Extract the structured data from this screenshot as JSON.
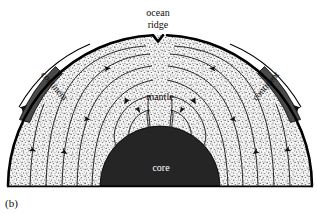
{
  "figure": {
    "panel_label": "(b)",
    "title_note": "",
    "labels": {
      "ocean_ridge_line1": "ocean",
      "ocean_ridge_line2": "ridge",
      "mantle": "mantle",
      "core": "core",
      "continent_left": "continent",
      "continent_right": "continent"
    },
    "colors": {
      "core_fill": "#252525",
      "mantle_fill": "#f2f2f2",
      "continent_fill": "#4a4a4a",
      "outline": "#000000",
      "core_text": "#ffffff",
      "background": "#ffffff"
    },
    "geometry": {
      "baseline_y": 186,
      "dome_center_x": 160,
      "dome_radius": 152,
      "core_radius": 60,
      "ridge_notch_x": 158
    },
    "elements": [
      "outer-crust-arc",
      "mantle-stipple-region",
      "core-dome",
      "convection-streamlines",
      "continent-slab-left",
      "continent-slab-right",
      "plate-motion-arrow-left",
      "plate-motion-arrow-right",
      "ocean-ridge-notch"
    ]
  }
}
